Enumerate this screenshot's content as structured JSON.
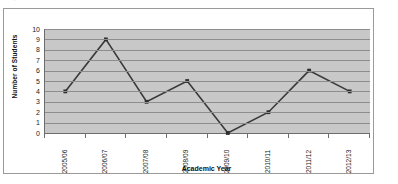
{
  "artifact_text": "o                                        o                    ,",
  "chart_data": {
    "type": "line",
    "title": "",
    "xlabel": "Academic Year",
    "ylabel": "Number of Students",
    "categories": [
      "2005/06",
      "2006/07",
      "2007/08",
      "2008/09",
      "2009/10",
      "2010/11",
      "2011/12",
      "2012/13"
    ],
    "values": [
      4,
      9,
      3,
      5,
      0,
      2,
      6,
      4
    ],
    "series": [
      {
        "name": "Number of Students",
        "values": [
          4,
          9,
          3,
          5,
          0,
          2,
          6,
          4
        ]
      }
    ],
    "ylim": [
      0,
      10
    ],
    "ytick_step": 1,
    "yticks": [
      10,
      9,
      8,
      7,
      6,
      5,
      4,
      3,
      2,
      1,
      0
    ],
    "grid": true,
    "grid_axis": "y",
    "legend": false,
    "legend_position": "none",
    "marker": "square",
    "colors": {
      "line": "#3a3a3a",
      "marker": "#2e2e2e",
      "plot_background": "#c8c8c8",
      "gridline": "#8d8d8d",
      "axis": "#6d6d6d",
      "frame_border": "#9a9a9a",
      "page_background": "#ffffff"
    }
  }
}
